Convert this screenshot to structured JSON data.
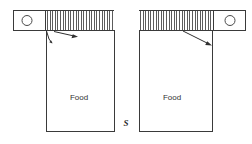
{
  "diagram": {
    "canvas": {
      "width": 252,
      "height": 144,
      "background": "#ffffff"
    },
    "stroke_color": "#3a3a3a",
    "hatch_color": "#4a4a4a",
    "text_color": "#333333",
    "hoppers": [
      {
        "id": "left-hopper",
        "label": "Food",
        "label_x": 79,
        "label_y": 98,
        "body": {
          "x": 46,
          "y": 31,
          "width": 68,
          "height": 101
        },
        "feeder": {
          "x": 46,
          "y": 10,
          "width": 68,
          "height": 21
        },
        "hatch_count": 26
      },
      {
        "id": "right-hopper",
        "label": "Food",
        "label_x": 172,
        "label_y": 98,
        "body": {
          "x": 139,
          "y": 31,
          "width": 74,
          "height": 101
        },
        "feeder": {
          "x": 139,
          "y": 10,
          "width": 74,
          "height": 21
        },
        "hatch_count": 28
      }
    ],
    "rollers": [
      {
        "id": "left-roller",
        "box": {
          "x": 13,
          "y": 10,
          "width": 33,
          "height": 21
        },
        "circle": {
          "cx": 27,
          "cy": 20,
          "r": 5
        }
      },
      {
        "id": "right-roller",
        "box": {
          "x": 213,
          "y": 10,
          "width": 33,
          "height": 21
        },
        "circle": {
          "cx": 230,
          "cy": 20,
          "r": 5
        }
      }
    ],
    "gap": {
      "label": "S",
      "label_x": 126,
      "label_y": 124,
      "left_edge_x": 114,
      "right_edge_x": 139,
      "top_y": 31,
      "bottom_y": 132
    },
    "flow_arrows": [
      {
        "id": "left-flow-arrow",
        "from_x": 54,
        "from_y": 31,
        "to_x": 77,
        "to_y": 37,
        "note": "flow indicator inside left feeder outlet"
      },
      {
        "id": "left-corner-arrow",
        "from_x": 46,
        "from_y": 31,
        "to_x": 53,
        "to_y": 44,
        "note": "corner deflector on left hopper wall"
      },
      {
        "id": "right-flow-arrow",
        "from_x": 183,
        "from_y": 31,
        "to_x": 211,
        "to_y": 45,
        "note": "flow indicator inside right feeder outlet"
      }
    ]
  }
}
